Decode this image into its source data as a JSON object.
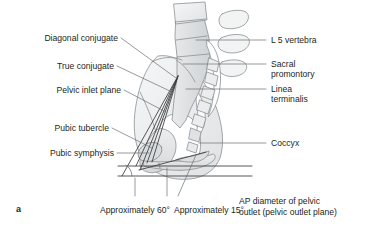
{
  "figure": {
    "panel_id": "a",
    "background": "#ffffff",
    "ink_color": "#231f20",
    "bone_outline": "#8c9196",
    "bone_fill_light": "#f2f3f3",
    "bone_fill_mid": "#e3e5e6",
    "bone_fill_dark": "#d4d7d9",
    "leader_color": "#58595b"
  },
  "labels_left": [
    {
      "id": "diagonal-conjugate",
      "text": "Diagonal conjugate",
      "x": 22,
      "y": 38
    },
    {
      "id": "true-conjugate",
      "text": "True conjugate",
      "x": 44,
      "y": 66
    },
    {
      "id": "pelvic-inlet-plane",
      "text": "Pelvic inlet plane",
      "x": 35,
      "y": 90
    },
    {
      "id": "pubic-tubercle",
      "text": "Pubic tubercle",
      "x": 42,
      "y": 128
    },
    {
      "id": "pubic-symphysis",
      "text": "Pubic symphysis",
      "x": 33,
      "y": 153
    }
  ],
  "labels_right": [
    {
      "id": "l5-vertebra",
      "text": "L 5 vertebra",
      "x": 272,
      "y": 40
    },
    {
      "id": "sacral-promontory",
      "text": "Sacral\npromontory",
      "line1": "Sacral",
      "line2": "promontory",
      "x": 272,
      "y": 64
    },
    {
      "id": "linea-terminalis",
      "text": "Linea\nterminalis",
      "line1": "Linea",
      "line2": "terminalis",
      "x": 272,
      "y": 89
    },
    {
      "id": "coccyx",
      "text": "Coccyx",
      "x": 272,
      "y": 143
    }
  ],
  "labels_bottom": [
    {
      "id": "angle-60",
      "text": "Approximately 60°",
      "x": 135,
      "y": 212
    },
    {
      "id": "angle-15",
      "text": "Approximately 15°",
      "x": 209,
      "y": 212
    },
    {
      "id": "ap-diameter-outlet-line1",
      "text": "AP diameter of pelvic",
      "x": 240,
      "y": 203
    },
    {
      "id": "ap-diameter-outlet-line2",
      "text": "outlet (pelvic outlet plane)",
      "x": 240,
      "y": 214
    }
  ],
  "measurements": {
    "pelvic_inclination_deg": 60,
    "outlet_plane_angle_deg": 15,
    "angle_unit": "°"
  }
}
